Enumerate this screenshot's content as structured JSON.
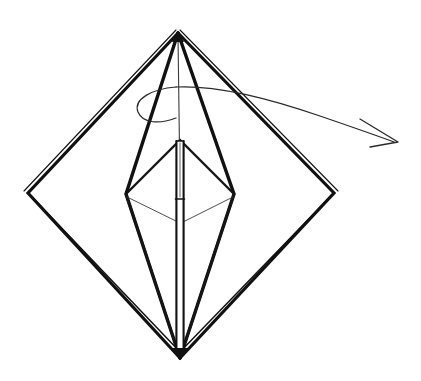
{
  "figure": {
    "background_color": "#ffffff",
    "ink_color": "#111111",
    "canvas": {
      "width": 421,
      "height": 381
    }
  },
  "chart_data": {
    "type": "diagram",
    "xlabel": "",
    "ylabel": "",
    "xlim": [
      0,
      421
    ],
    "ylim": [
      0,
      381
    ],
    "grid": false,
    "legend": "none",
    "annotations": [
      "rotation arrow sweeping clockwise around the vertical axis"
    ],
    "points": {
      "apex_top": [
        178,
        33
      ],
      "vertex_bottom": [
        180,
        358
      ],
      "vertex_left": [
        28,
        193
      ],
      "vertex_right": [
        334,
        193
      ],
      "inner_apex": [
        180,
        140
      ],
      "inner_left": [
        126,
        194
      ],
      "inner_right": [
        234,
        194
      ],
      "axis_top": [
        178,
        36
      ],
      "axis_bottom": [
        180,
        352
      ],
      "arrow_tip": [
        398,
        142
      ],
      "ellipse_center": [
        205,
        103
      ],
      "ellipse_rx": 70,
      "ellipse_ry": 16
    },
    "series": [
      {
        "name": "outer-diamond",
        "kind": "polygon",
        "closed": true,
        "stroke_width": 3.2,
        "doubled_edges": true,
        "values": [
          [
            178,
            33
          ],
          [
            334,
            193
          ],
          [
            180,
            358
          ],
          [
            28,
            193
          ]
        ]
      },
      {
        "name": "outer-bipyramid-left-face",
        "kind": "polyline",
        "closed": false,
        "stroke_width": 3.0,
        "values": [
          [
            178,
            33
          ],
          [
            126,
            194
          ],
          [
            180,
            358
          ]
        ]
      },
      {
        "name": "outer-bipyramid-right-face",
        "kind": "polyline",
        "closed": false,
        "stroke_width": 3.0,
        "values": [
          [
            178,
            33
          ],
          [
            234,
            194
          ],
          [
            180,
            358
          ]
        ]
      },
      {
        "name": "inner-bipyramid-left-face",
        "kind": "polyline",
        "closed": false,
        "stroke_width": 2.2,
        "values": [
          [
            180,
            140
          ],
          [
            126,
            194
          ],
          [
            180,
            358
          ]
        ]
      },
      {
        "name": "inner-bipyramid-right-face",
        "kind": "polyline",
        "closed": false,
        "stroke_width": 2.2,
        "values": [
          [
            180,
            140
          ],
          [
            234,
            194
          ],
          [
            180,
            358
          ]
        ]
      },
      {
        "name": "hidden-equator-left",
        "kind": "polyline",
        "closed": false,
        "stroke_width": 0.9,
        "values": [
          [
            126,
            196
          ],
          [
            180,
            222
          ]
        ]
      },
      {
        "name": "hidden-equator-right",
        "kind": "polyline",
        "closed": false,
        "stroke_width": 0.9,
        "values": [
          [
            234,
            196
          ],
          [
            181,
            222
          ]
        ]
      },
      {
        "name": "central-axis-shaft",
        "kind": "rect",
        "stroke_width": 2.0,
        "values": [
          [
            176,
            141
          ],
          [
            184,
            352
          ]
        ]
      },
      {
        "name": "axis-hairline-upper",
        "kind": "polyline",
        "closed": false,
        "stroke_width": 1.0,
        "values": [
          [
            178,
            36
          ],
          [
            179,
            141
          ]
        ]
      },
      {
        "name": "shaft-divider",
        "kind": "polyline",
        "closed": false,
        "stroke_width": 1.6,
        "values": [
          [
            176,
            199
          ],
          [
            184,
            199
          ]
        ]
      },
      {
        "name": "rotation-arc",
        "kind": "arc",
        "stroke_width": 1.2,
        "values": [
          [
            138,
            113
          ],
          [
            150,
            93
          ],
          [
            205,
            88
          ],
          [
            262,
            98
          ],
          [
            320,
            117
          ],
          [
            392,
            141
          ]
        ]
      },
      {
        "name": "rotation-arc-tail",
        "kind": "arc",
        "stroke_width": 1.2,
        "values": [
          [
            138,
            113
          ],
          [
            144,
            120
          ],
          [
            158,
            122
          ],
          [
            176,
            118
          ]
        ]
      },
      {
        "name": "arrowhead",
        "kind": "polyline",
        "closed": false,
        "stroke_width": 1.2,
        "values": [
          [
            361,
            120
          ],
          [
            398,
            142
          ],
          [
            371,
            146
          ]
        ]
      }
    ]
  }
}
